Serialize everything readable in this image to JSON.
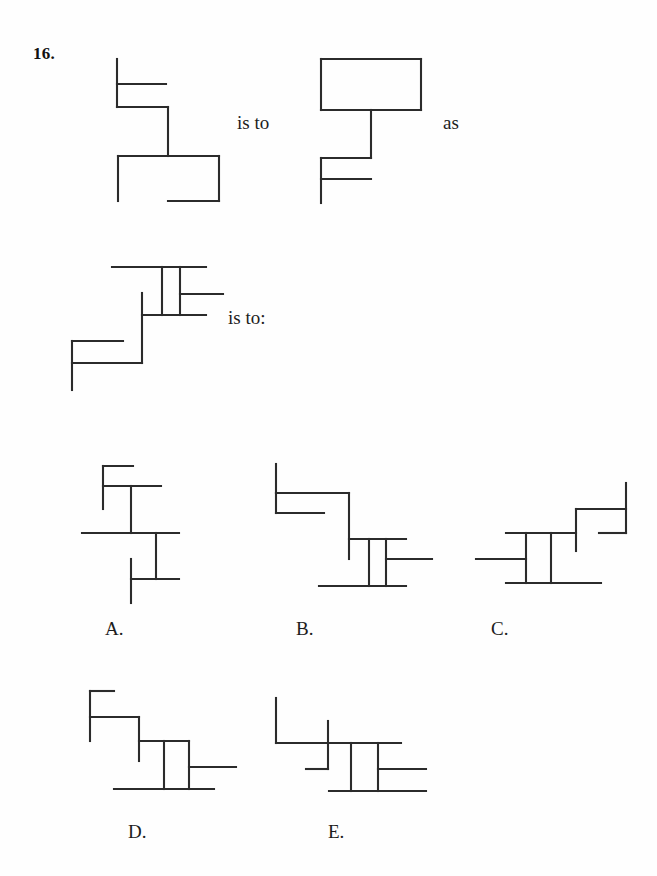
{
  "page": {
    "background_color": "#fefefe",
    "ink_color": "#2b2b2b",
    "question_number": "16."
  },
  "connectors": {
    "is_to_first": "is to",
    "as": "as",
    "is_to_second": "is to:"
  },
  "option_labels": {
    "a": "A.",
    "b": "B.",
    "c": "C.",
    "d": "D.",
    "e": "E."
  },
  "figures": {
    "prompt_a": {
      "name": "figure-prompt-a",
      "lines": [
        [
          117,
          59,
          117,
          107
        ],
        [
          117,
          84,
          166,
          84
        ],
        [
          117,
          107,
          168,
          107
        ],
        [
          168,
          107,
          168,
          156
        ],
        [
          118,
          156,
          219,
          156
        ],
        [
          118,
          156,
          118,
          201
        ],
        [
          219,
          156,
          219,
          201
        ],
        [
          168,
          201,
          219,
          201
        ]
      ]
    },
    "prompt_b": {
      "name": "figure-prompt-b",
      "lines": [
        [
          321,
          59,
          421,
          59
        ],
        [
          321,
          59,
          321,
          110
        ],
        [
          421,
          59,
          421,
          110
        ],
        [
          321,
          110,
          421,
          110
        ],
        [
          371,
          59,
          371,
          59
        ],
        [
          371,
          110,
          371,
          158
        ],
        [
          321,
          158,
          371,
          158
        ],
        [
          321,
          158,
          321,
          203
        ],
        [
          321,
          179,
          371,
          179
        ]
      ]
    },
    "question": {
      "name": "figure-question",
      "lines": [
        [
          112,
          267,
          206,
          267
        ],
        [
          162,
          267,
          162,
          315
        ],
        [
          180,
          267,
          180,
          315
        ],
        [
          180,
          294,
          223,
          294
        ],
        [
          142,
          315,
          206,
          315
        ],
        [
          142,
          293,
          142,
          363
        ],
        [
          72,
          341,
          123,
          341
        ],
        [
          72,
          363,
          142,
          363
        ],
        [
          72,
          341,
          72,
          390
        ]
      ]
    },
    "option_a": {
      "name": "figure-option-a",
      "lines": [
        [
          103,
          466,
          133,
          466
        ],
        [
          103,
          466,
          103,
          509
        ],
        [
          103,
          486,
          161,
          486
        ],
        [
          131,
          486,
          131,
          533
        ],
        [
          82,
          533,
          179,
          533
        ],
        [
          156,
          533,
          156,
          579
        ],
        [
          131,
          579,
          179,
          579
        ],
        [
          131,
          559,
          131,
          603
        ]
      ]
    },
    "option_b": {
      "name": "figure-option-b",
      "lines": [
        [
          276,
          464,
          276,
          493
        ],
        [
          276,
          493,
          349,
          493
        ],
        [
          276,
          493,
          276,
          513
        ],
        [
          276,
          513,
          324,
          513
        ],
        [
          349,
          493,
          349,
          559
        ],
        [
          349,
          539,
          406,
          539
        ],
        [
          369,
          539,
          369,
          586
        ],
        [
          386,
          539,
          386,
          586
        ],
        [
          386,
          559,
          432,
          559
        ],
        [
          319,
          586,
          406,
          586
        ]
      ]
    },
    "option_c": {
      "name": "figure-option-c",
      "lines": [
        [
          626,
          483,
          626,
          533
        ],
        [
          576,
          509,
          626,
          509
        ],
        [
          576,
          509,
          576,
          551
        ],
        [
          599,
          533,
          626,
          533
        ],
        [
          506,
          533,
          576,
          533
        ],
        [
          526,
          533,
          526,
          583
        ],
        [
          551,
          533,
          551,
          583
        ],
        [
          476,
          559,
          526,
          559
        ],
        [
          506,
          583,
          601,
          583
        ]
      ]
    },
    "option_d": {
      "name": "figure-option-d",
      "lines": [
        [
          90,
          691,
          114,
          691
        ],
        [
          90,
          691,
          90,
          741
        ],
        [
          90,
          717,
          139,
          717
        ],
        [
          139,
          717,
          139,
          761
        ],
        [
          139,
          741,
          189,
          741
        ],
        [
          164,
          741,
          164,
          789
        ],
        [
          189,
          741,
          189,
          789
        ],
        [
          189,
          767,
          236,
          767
        ],
        [
          114,
          789,
          214,
          789
        ]
      ]
    },
    "option_e": {
      "name": "figure-option-e",
      "lines": [
        [
          276,
          698,
          276,
          743
        ],
        [
          276,
          743,
          401,
          743
        ],
        [
          328,
          721,
          328,
          769
        ],
        [
          306,
          769,
          328,
          769
        ],
        [
          351,
          743,
          351,
          791
        ],
        [
          378,
          743,
          378,
          791
        ],
        [
          378,
          769,
          426,
          769
        ],
        [
          329,
          791,
          426,
          791
        ]
      ]
    }
  }
}
